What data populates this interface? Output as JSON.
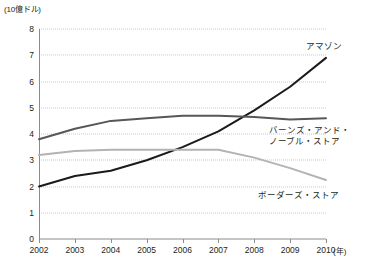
{
  "axis": {
    "y_unit_label": "(10億ドル)",
    "x_unit_label": "(年)",
    "y_ticks": [
      "0",
      "1",
      "2",
      "3",
      "4",
      "5",
      "6",
      "7",
      "8"
    ],
    "x_ticks": [
      "2002",
      "2003",
      "2004",
      "2005",
      "2006",
      "2007",
      "2008",
      "2009",
      "2010"
    ]
  },
  "series_labels": {
    "amazon": "アマゾン",
    "barnes_noble_line1": "バーンズ・アンド・",
    "barnes_noble_line2": "ノーブル・ストア",
    "borders": "ボーダーズ・ストア"
  },
  "colors": {
    "amazon": "#1a1a1a",
    "barnes_noble": "#575757",
    "borders": "#b3b3b3",
    "gridline": "#c9c9c9",
    "axis": "#8c8c8c",
    "text": "#231f20"
  },
  "chart_data": {
    "type": "line",
    "title": "",
    "xlabel": "(年)",
    "ylabel": "(10億ドル)",
    "x": [
      2002,
      2003,
      2004,
      2005,
      2006,
      2007,
      2008,
      2009,
      2010
    ],
    "categories": [
      "2002",
      "2003",
      "2004",
      "2005",
      "2006",
      "2007",
      "2008",
      "2009",
      "2010"
    ],
    "ylim": [
      0,
      8
    ],
    "xlim": [
      2002,
      2010
    ],
    "grid": true,
    "legend_position": "inline-right",
    "series": [
      {
        "name": "アマゾン",
        "color": "#1a1a1a",
        "values": [
          2.0,
          2.4,
          2.6,
          3.0,
          3.5,
          4.1,
          4.9,
          5.8,
          6.9
        ]
      },
      {
        "name": "バーンズ・アンド・ノーブル・ストア",
        "color": "#575757",
        "values": [
          3.8,
          4.2,
          4.5,
          4.6,
          4.7,
          4.7,
          4.65,
          4.55,
          4.6
        ]
      },
      {
        "name": "ボーダーズ・ストア",
        "color": "#b3b3b3",
        "values": [
          3.2,
          3.35,
          3.4,
          3.4,
          3.4,
          3.4,
          3.1,
          2.7,
          2.25
        ]
      }
    ]
  }
}
